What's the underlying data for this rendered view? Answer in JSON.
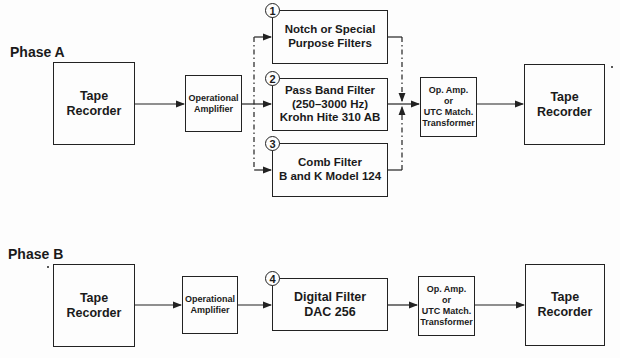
{
  "phase_a": {
    "label": "Phase A",
    "source": {
      "line1": "Tape",
      "line2": "Recorder"
    },
    "amp": {
      "line1": "Operational",
      "line2": "Amplifier"
    },
    "filters": [
      {
        "number": "1",
        "line1": "Notch or Special",
        "line2": "Purpose Filters",
        "line3": ""
      },
      {
        "number": "2",
        "line1": "Pass Band Filter",
        "line2": "(250–3000 Hz)",
        "line3": "Krohn Hite 310 AB"
      },
      {
        "number": "3",
        "line1": "Comb Filter",
        "line2": "B and K Model 124",
        "line3": ""
      }
    ],
    "output_stage": {
      "line1": "Op. Amp.",
      "line2": "or",
      "line3": "UTC Match.",
      "line4": "Transformer"
    },
    "destination": {
      "line1": "Tape",
      "line2": "Recorder"
    }
  },
  "phase_b": {
    "label": "Phase B",
    "source": {
      "line1": "Tape",
      "line2": "Recorder"
    },
    "amp": {
      "line1": "Operational",
      "line2": "Amplifier"
    },
    "filter": {
      "number": "4",
      "line1": "Digital Filter",
      "line2": "DAC 256"
    },
    "output_stage": {
      "line1": "Op. Amp.",
      "line2": "or",
      "line3": "UTC Match.",
      "line4": "Transformer"
    },
    "destination": {
      "line1": "Tape",
      "line2": "Recorder"
    }
  }
}
